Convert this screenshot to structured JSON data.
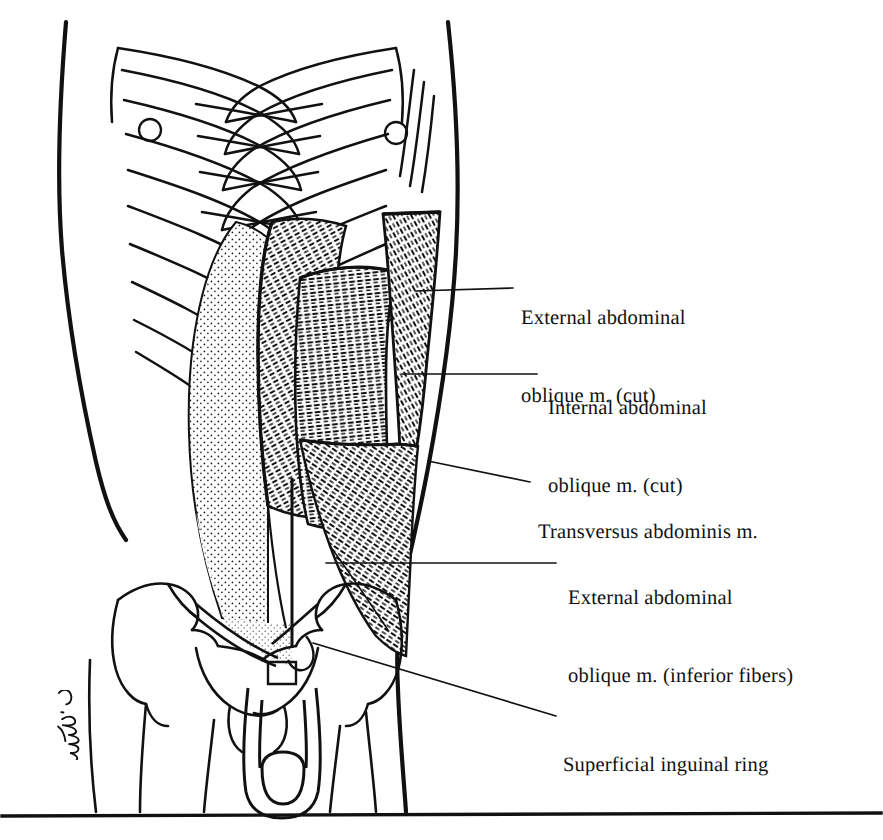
{
  "plate": {
    "title": "Anterior Abdominal Wall — Muscle Layers",
    "width": 883,
    "height": 840,
    "background_color": "#ffffff",
    "ink_color": "#111111",
    "style": "black-and-white pen-and-ink anatomical line drawing with stipple and hatch shading"
  },
  "labels": [
    {
      "id": "external-oblique-cut",
      "line1": "External abdominal",
      "line2": "oblique m. (cut)",
      "leader": {
        "x1": 513,
        "y1": 288,
        "x2": 415,
        "y2": 291
      }
    },
    {
      "id": "internal-oblique-cut",
      "line1": "Internal abdominal",
      "line2": "oblique m. (cut)",
      "leader": {
        "x1": 537,
        "y1": 374,
        "x2": 402,
        "y2": 374
      }
    },
    {
      "id": "transversus-abdominis",
      "line1": "Transversus abdominis m.",
      "line2": "",
      "leader": {
        "x1": 530,
        "y1": 482,
        "x2": 428,
        "y2": 461
      }
    },
    {
      "id": "external-oblique-inferior",
      "line1": "External abdominal",
      "line2": "oblique m. (inferior fibers)",
      "leader": {
        "x1": 556,
        "y1": 563,
        "x2": 326,
        "y2": 563
      }
    },
    {
      "id": "superficial-inguinal-ring",
      "line1": "Superficial inguinal ring",
      "line2": "",
      "leader": {
        "x1": 556,
        "y1": 716,
        "x2": 313,
        "y2": 643
      }
    }
  ],
  "signature": {
    "text": "C. Machado",
    "description": "artist cursive signature, rotated, lower-left on the thigh"
  },
  "footer_rule": {
    "y": 815,
    "x1": 2,
    "x2": 881
  },
  "anatomy": {
    "structures": [
      "rib cage with costal cartilages",
      "nipples",
      "xiphoid process",
      "external abdominal oblique muscle (reflected / cut flap)",
      "internal abdominal oblique muscle (reflected / cut flap)",
      "transversus abdominis muscle",
      "rectus sheath",
      "linea alba",
      "inguinal ligament",
      "superficial inguinal ring",
      "iliac crest and pelvis",
      "femoral heads",
      "pubic symphysis",
      "external genitalia outline"
    ]
  }
}
